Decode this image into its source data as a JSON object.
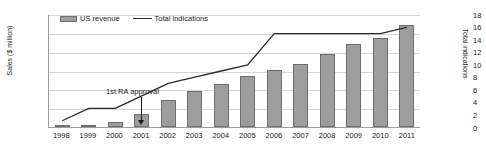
{
  "chart_data": {
    "type": "bar",
    "title": "",
    "xlabel": "",
    "ylabel": "Sales ($ million)",
    "y2label": "Total indications",
    "grid": true,
    "legend_position": "top-left",
    "categories": [
      "1998",
      "1999",
      "2000",
      "2001",
      "2002",
      "2003",
      "2004",
      "2005",
      "2006",
      "2007",
      "2008",
      "2009",
      "2010",
      "2011"
    ],
    "ylim": [
      0,
      6000
    ],
    "yticks": [
      "0",
      "1,000",
      "2,000",
      "3,000",
      "4,000",
      "5,000",
      "6,000"
    ],
    "ytick_values": [
      0,
      1000,
      2000,
      3000,
      4000,
      5000,
      6000
    ],
    "y2lim": [
      0,
      18
    ],
    "y2ticks": [
      "0",
      "2",
      "4",
      "6",
      "8",
      "10",
      "12",
      "14",
      "16",
      "18"
    ],
    "y2tick_values": [
      0,
      2,
      4,
      6,
      8,
      10,
      12,
      14,
      16,
      18
    ],
    "series": [
      {
        "name": "US revenue",
        "type": "bar",
        "axis": "left",
        "color": "#9d9d9d",
        "edge_color": "#6e6e6e",
        "values": [
          30,
          120,
          250,
          700,
          1450,
          1900,
          2300,
          2700,
          3050,
          3350,
          3900,
          4400,
          4700,
          5400
        ]
      },
      {
        "name": "Total indications",
        "type": "line",
        "axis": "right",
        "color": "#2b2b2b",
        "values": [
          1,
          3,
          3,
          5,
          7,
          8,
          9,
          10,
          15,
          15,
          15,
          15,
          15,
          16
        ]
      }
    ],
    "annotations": [
      {
        "text": "1st RA approval",
        "points_to_category": "1999",
        "points_to_value": 3
      }
    ]
  },
  "legend": {
    "items": [
      {
        "label": "US revenue",
        "marker": "bar-swatch"
      },
      {
        "label": "Total indications",
        "marker": "line-swatch"
      }
    ]
  }
}
